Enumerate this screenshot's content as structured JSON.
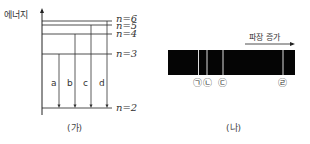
{
  "panel_ga": {
    "y_axis_label": "에너지",
    "levels": [
      {
        "label": "n=6",
        "y": 21
      },
      {
        "label": "n=5",
        "y": 25
      },
      {
        "label": "n=4",
        "y": 34
      },
      {
        "label": "n=3",
        "y": 54
      },
      {
        "label": "n=2",
        "y": 108
      }
    ],
    "transitions": [
      {
        "label": "a",
        "from": "n=3",
        "to": "n=2"
      },
      {
        "label": "b",
        "from": "n=4",
        "to": "n=2"
      },
      {
        "label": "c",
        "from": "n=5",
        "to": "n=2"
      },
      {
        "label": "d",
        "from": "n=6",
        "to": "n=2"
      }
    ],
    "caption": "(가)"
  },
  "panel_na": {
    "arrow_label": "파장 증가",
    "lines": [
      {
        "label": "㉠"
      },
      {
        "label": "㉡"
      },
      {
        "label": "㉢"
      },
      {
        "label": "㉣"
      }
    ],
    "caption": "(나)"
  }
}
